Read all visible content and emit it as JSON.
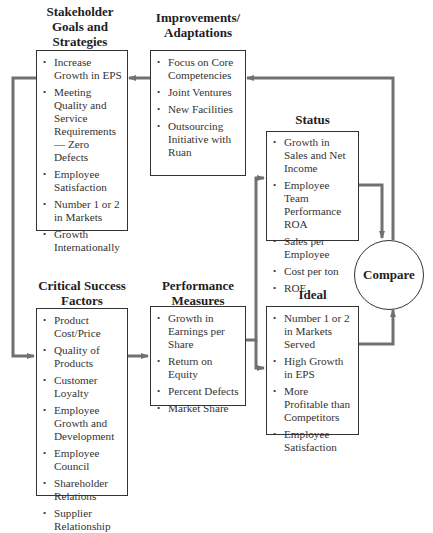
{
  "diagram": {
    "nodes": {
      "stakeholder": {
        "title_lines": [
          "Stakeholder",
          "Goals and",
          "Strategies"
        ],
        "items": [
          "Increase Growth in EPS",
          "Meeting Quality and Service Requirements— Zero Defects",
          "Employee Satisfaction",
          "Number 1 or 2 in Markets",
          "Growth Internationally"
        ]
      },
      "improvements": {
        "title_lines": [
          "Improvements/",
          "Adaptations"
        ],
        "items": [
          "Focus on Core Competencies",
          "Joint Ventures",
          "New Facilities",
          "Outsourcing Initiative with Ruan"
        ]
      },
      "status": {
        "title_lines": [
          "Status"
        ],
        "items": [
          "Growth in Sales and Net Income",
          "Employee Team Performance ROA",
          "Sales per Employee",
          "Cost per ton",
          "ROE"
        ]
      },
      "compare": {
        "label": "Compare"
      },
      "critical": {
        "title_lines": [
          "Critical Success",
          "Factors"
        ],
        "items": [
          "Product Cost/Price",
          "Quality of Products",
          "Customer Loyalty",
          "Employee Growth and Development",
          "Employee Council",
          "Shareholder Relations",
          "Supplier Relationship"
        ]
      },
      "performance": {
        "title_lines": [
          "Performance",
          "Measures"
        ],
        "items": [
          "Growth in Earnings per Share",
          "Return on Equity",
          "Percent Defects",
          "Market Share"
        ]
      },
      "ideal": {
        "title_lines": [
          "Ideal"
        ],
        "items": [
          "Number 1 or 2 in Markets Served",
          "High Growth in EPS",
          "More Profitable than Competitors",
          "Employee Satisfaction"
        ]
      }
    },
    "edges": [
      {
        "from": "stakeholder",
        "to": "critical"
      },
      {
        "from": "critical",
        "to": "performance"
      },
      {
        "from": "performance",
        "to": "status"
      },
      {
        "from": "performance",
        "to": "ideal"
      },
      {
        "from": "status",
        "to": "compare"
      },
      {
        "from": "ideal",
        "to": "compare"
      },
      {
        "from": "compare",
        "to": "improvements"
      },
      {
        "from": "improvements",
        "to": "stakeholder"
      }
    ],
    "colors": {
      "box_border": "#333333",
      "connector": "#707070",
      "text": "#333333"
    }
  }
}
